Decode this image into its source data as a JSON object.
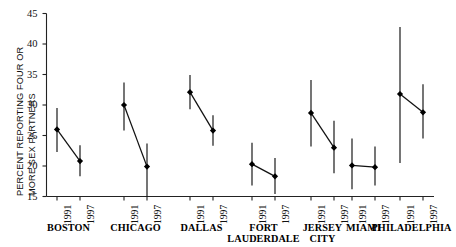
{
  "chart_data": {
    "type": "line",
    "title": "",
    "subtitle": "",
    "xlabel": "",
    "ylabel": "PERCENT REPORTING FOUR OR MORE SEX PARTNERS",
    "ylabel_lines": [
      "PERCENT REPORTING FOUR OR",
      "MORE SEX PARTNERS"
    ],
    "ylim": [
      15,
      45
    ],
    "yticks": [
      15,
      20,
      25,
      30,
      35,
      40,
      45
    ],
    "ytick_labels": [
      "15",
      "20",
      "25",
      "30",
      "35",
      "40",
      "45"
    ],
    "grid": false,
    "legend": "none",
    "error_bars": "95% confidence interval",
    "marker": "filled-diamond",
    "x_categories": [
      "1991",
      "1997"
    ],
    "groups": [
      {
        "name": "BOSTON",
        "name_lines": [
          "BOSTON"
        ],
        "points": [
          {
            "year": "1991",
            "value": 26.0,
            "low": 22.3,
            "high": 29.5
          },
          {
            "year": "1997",
            "value": 20.8,
            "low": 18.3,
            "high": 23.4
          }
        ]
      },
      {
        "name": "CHICAGO",
        "name_lines": [
          "CHICAGO"
        ],
        "points": [
          {
            "year": "1991",
            "value": 30.0,
            "low": 25.8,
            "high": 33.7
          },
          {
            "year": "1997",
            "value": 19.9,
            "low": 15.0,
            "high": 23.7
          }
        ]
      },
      {
        "name": "DALLAS",
        "name_lines": [
          "DALLAS"
        ],
        "points": [
          {
            "year": "1991",
            "value": 32.1,
            "low": 29.3,
            "high": 34.9
          },
          {
            "year": "1997",
            "value": 25.8,
            "low": 23.3,
            "high": 28.3
          }
        ]
      },
      {
        "name": "FORT LAUDERDALE",
        "name_lines": [
          "FORT",
          "LAUDERDALE"
        ],
        "points": [
          {
            "year": "1991",
            "value": 20.3,
            "low": 16.8,
            "high": 23.8
          },
          {
            "year": "1997",
            "value": 18.3,
            "low": 15.4,
            "high": 21.3
          }
        ]
      },
      {
        "name": "JERSEY CITY",
        "name_lines": [
          "JERSEY",
          "CITY"
        ],
        "points": [
          {
            "year": "1991",
            "value": 28.7,
            "low": 23.2,
            "high": 34.1
          },
          {
            "year": "1997",
            "value": 23.0,
            "low": 18.8,
            "high": 27.4
          }
        ]
      },
      {
        "name": "MIAMI",
        "name_lines": [
          "MIAMI"
        ],
        "points": [
          {
            "year": "1991",
            "value": 20.1,
            "low": 16.2,
            "high": 24.5
          },
          {
            "year": "1997",
            "value": 19.8,
            "low": 16.8,
            "high": 23.2
          }
        ]
      },
      {
        "name": "PHILADELPHIA",
        "name_lines": [
          "PHILADELPHIA"
        ],
        "points": [
          {
            "year": "1991",
            "value": 31.8,
            "low": 20.5,
            "high": 42.8
          },
          {
            "year": "1997",
            "value": 28.8,
            "low": 24.5,
            "high": 33.4
          }
        ]
      }
    ],
    "colors": {
      "line": "#111111",
      "marker": "#000000",
      "axis": "#222222",
      "background": "#ffffff"
    }
  }
}
